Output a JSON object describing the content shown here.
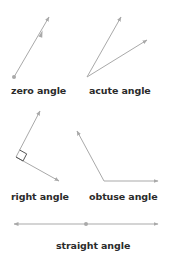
{
  "diagram": {
    "line_color": "#a9a9a9",
    "text_color": "#2b2b2b",
    "angles": [
      {
        "label": "zero angle",
        "vertex": [
          14,
          77
        ],
        "rays": [
          [
            49,
            17
          ]
        ],
        "note": "two coincident rays"
      },
      {
        "label": "acute angle",
        "vertex": [
          87,
          77
        ],
        "rays": [
          [
            121,
            17
          ],
          [
            147,
            40
          ]
        ]
      },
      {
        "label": "right angle",
        "vertex": [
          16,
          157
        ],
        "rays": [
          [
            40,
            111
          ],
          [
            59,
            181
          ]
        ],
        "right_angle_marker": true
      },
      {
        "label": "obtuse angle",
        "vertex": [
          104,
          181
        ],
        "rays": [
          [
            77,
            131
          ],
          [
            158,
            181
          ]
        ]
      },
      {
        "label": "straight angle",
        "vertex": [
          86,
          224
        ],
        "rays": [
          [
            14,
            224
          ],
          [
            158,
            224
          ]
        ]
      }
    ]
  }
}
